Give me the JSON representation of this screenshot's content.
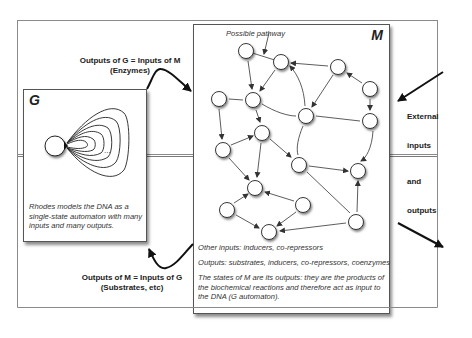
{
  "diagram": {
    "g_box": {
      "title": "G",
      "caption": "Rhodes models the DNA as a single-state automaton with many inputs and many outputs.",
      "ellipsis": "..."
    },
    "m_box": {
      "title": "M",
      "pathway_label": "Possible pathway",
      "other_inputs": "Other inputs: inducers, co-repressors",
      "outputs": "Outputs: substrates, inducers, co-repressors, coenzymes",
      "states_note": "The states of M are its outputs: they are the products of the biochemical reactions and therefore act as input to the DNA (G automaton)."
    },
    "top_arrow_label": {
      "line1": "Outputs of G = Inputs of M",
      "line2": "(Enzymes)"
    },
    "bottom_arrow_label": {
      "line1": "Outputs of M = Inputs of G",
      "line2": "(Substrates, etc)"
    },
    "external": {
      "word1": "External",
      "word2": "inputs",
      "word3": "and",
      "word4": "outputs"
    },
    "network": {
      "nodes": [
        {
          "id": 1,
          "x": 246,
          "y": 51
        },
        {
          "id": 2,
          "x": 281,
          "y": 62
        },
        {
          "id": 3,
          "x": 338,
          "y": 67
        },
        {
          "id": 4,
          "x": 370,
          "y": 89
        },
        {
          "id": 5,
          "x": 219,
          "y": 99
        },
        {
          "id": 6,
          "x": 253,
          "y": 100
        },
        {
          "id": 7,
          "x": 306,
          "y": 116
        },
        {
          "id": 8,
          "x": 370,
          "y": 121
        },
        {
          "id": 9,
          "x": 262,
          "y": 133
        },
        {
          "id": 10,
          "x": 223,
          "y": 150
        },
        {
          "id": 11,
          "x": 299,
          "y": 165
        },
        {
          "id": 12,
          "x": 358,
          "y": 171
        },
        {
          "id": 13,
          "x": 255,
          "y": 188
        },
        {
          "id": 14,
          "x": 227,
          "y": 210
        },
        {
          "id": 15,
          "x": 303,
          "y": 205
        },
        {
          "id": 16,
          "x": 269,
          "y": 232
        },
        {
          "id": 17,
          "x": 356,
          "y": 222
        }
      ]
    }
  }
}
